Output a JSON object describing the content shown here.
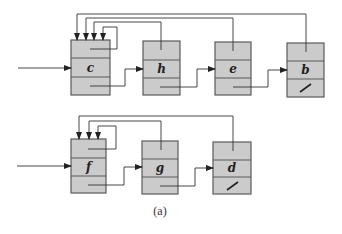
{
  "caption": "(a)",
  "colors": {
    "node_fill": "#cbcbcb",
    "node_border": "#5a5a5a",
    "line": "#333333"
  },
  "lists": [
    {
      "name": "top-list",
      "representative": "c",
      "nodes": [
        {
          "key": "c",
          "next": "h",
          "rep_pointer": "c",
          "nil_next": false
        },
        {
          "key": "h",
          "next": "e",
          "rep_pointer": "c",
          "nil_next": false
        },
        {
          "key": "e",
          "next": "b",
          "rep_pointer": "c",
          "nil_next": false
        },
        {
          "key": "b",
          "next": null,
          "rep_pointer": "c",
          "nil_next": true
        }
      ]
    },
    {
      "name": "bottom-list",
      "representative": "f",
      "nodes": [
        {
          "key": "f",
          "next": "g",
          "rep_pointer": "f",
          "nil_next": false
        },
        {
          "key": "g",
          "next": "d",
          "rep_pointer": "f",
          "nil_next": false
        },
        {
          "key": "d",
          "next": null,
          "rep_pointer": "f",
          "nil_next": true
        }
      ]
    }
  ]
}
